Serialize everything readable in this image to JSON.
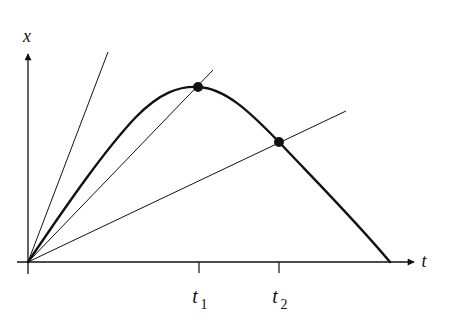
{
  "figure": {
    "type": "position-time diagram",
    "axes": {
      "x_axis_label": "t",
      "y_axis_label": "x"
    },
    "ticks": [
      {
        "label_main": "t",
        "label_sub": "1"
      },
      {
        "label_main": "t",
        "label_sub": "2"
      }
    ],
    "points": [
      {
        "name": "max-at-t1",
        "marker": "filled-circle"
      },
      {
        "name": "intersection-at-t2",
        "marker": "filled-circle"
      }
    ],
    "lines": [
      {
        "name": "steep-line",
        "through": "origin"
      },
      {
        "name": "line-through-t1-point",
        "through": "origin"
      },
      {
        "name": "line-through-t2-point",
        "through": "origin"
      }
    ],
    "colors": {
      "ink": "#111111",
      "background": "#ffffff"
    }
  }
}
